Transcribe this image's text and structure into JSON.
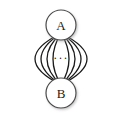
{
  "diagram": {
    "type": "multigraph",
    "title": "",
    "canvas": {
      "width": 116,
      "height": 115,
      "background": "#ffffff"
    },
    "style": {
      "edge_color": "#1a1a1a",
      "edge_width": 1.3,
      "node_stroke": "#4a4a4a",
      "node_fill": "#ffffff",
      "node_stroke_width": 1.2,
      "label_color": "#1a1a1a",
      "shadow_color": "#b8b8b8",
      "ellipsis_color": "#1a1a1a"
    },
    "nodes": [
      {
        "id": "A",
        "label": "A",
        "cx": 61,
        "cy": 25,
        "r": 15,
        "font_size": 13
      },
      {
        "id": "B",
        "label": "B",
        "cx": 61,
        "cy": 93,
        "r": 15,
        "font_size": 13
      }
    ],
    "ellipsis": {
      "label": "···",
      "x": 61,
      "y": 58,
      "font_size": 12
    },
    "edges": [
      {
        "id": "edge-1",
        "from": "A",
        "to": "B",
        "bow": -52,
        "side": "left"
      },
      {
        "id": "edge-2",
        "from": "A",
        "to": "B",
        "bow": -40,
        "side": "left"
      },
      {
        "id": "edge-3",
        "from": "A",
        "to": "B",
        "bow": -28,
        "side": "left"
      },
      {
        "id": "edge-4",
        "from": "A",
        "to": "B",
        "bow": -16,
        "side": "left"
      },
      {
        "id": "edge-5",
        "from": "A",
        "to": "B",
        "bow": 16,
        "side": "right"
      },
      {
        "id": "edge-6",
        "from": "A",
        "to": "B",
        "bow": 28,
        "side": "right"
      },
      {
        "id": "edge-7",
        "from": "A",
        "to": "B",
        "bow": 40,
        "side": "right"
      },
      {
        "id": "edge-8",
        "from": "A",
        "to": "B",
        "bow": 52,
        "side": "right"
      }
    ]
  }
}
